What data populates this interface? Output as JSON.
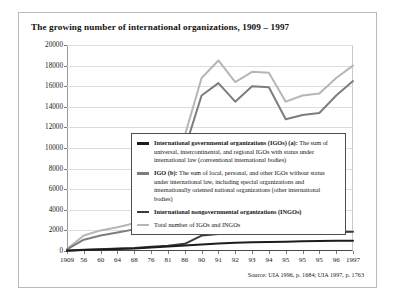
{
  "figure": {
    "title": "The growing number of international organizations, 1909 – 1997",
    "source": "Source: UIA 1996, p. 1684; UIA 1997, p. 1763"
  },
  "legend": {
    "entries": [
      {
        "name": "igo-a",
        "color": "#1c1c1c",
        "bold_label": "International governmental organizations (IGOs) (a):",
        "description": "The sum of universal, intercontinental, and regional IGOs with status under international law (conventional international bodies)"
      },
      {
        "name": "igo-b",
        "color": "#7d7d7d",
        "bold_label": "IGO (b):",
        "description": "The sum of local, personal, and other IGOs without status under international law, including special organizations and internationally oriented national organizations (other international bodies)"
      },
      {
        "name": "ingo",
        "color": "#3c3c3c",
        "bold_label": "International nongovernmental organizations (INGOs)",
        "description": ""
      },
      {
        "name": "total",
        "color": "#b6b6b6",
        "bold_label": "",
        "description": "Total number of IGOs and INGOs"
      }
    ]
  },
  "chart_data": {
    "type": "line",
    "title": "The growing number of international organizations, 1909 – 1997",
    "xlabel": "",
    "ylabel": "",
    "ylim": [
      0,
      20000
    ],
    "ytick_step": 2000,
    "yticks": [
      0,
      2000,
      4000,
      6000,
      8000,
      10000,
      12000,
      14000,
      16000,
      18000,
      20000
    ],
    "grid": true,
    "legend_position": "inset-center-right",
    "categories": [
      "1909",
      "56",
      "60",
      "64",
      "68",
      "76",
      "81",
      "86",
      "90",
      "91",
      "92",
      "93",
      "94",
      "95",
      "95",
      "95",
      "96",
      "1997"
    ],
    "series": [
      {
        "name": "Total number of IGOs and INGOs",
        "color": "#b6b6b6",
        "values": [
          200,
          1500,
          2000,
          2300,
          2700,
          4200,
          5200,
          11200,
          16800,
          18500,
          16400,
          17400,
          17300,
          14500,
          15100,
          15300,
          16800,
          18000
        ]
      },
      {
        "name": "IGO (b)",
        "color": "#7d7d7d",
        "values": [
          150,
          1100,
          1500,
          1800,
          2100,
          3400,
          4300,
          9900,
          15100,
          16300,
          14500,
          16000,
          15900,
          12800,
          13200,
          13400,
          15100,
          16500
        ]
      },
      {
        "name": "International nongovernmental organizations (INGOs)",
        "color": "#3c3c3c",
        "values": [
          40,
          120,
          180,
          240,
          300,
          420,
          520,
          700,
          1500,
          1650,
          1700,
          1750,
          1780,
          1800,
          1820,
          1830,
          1850,
          1870
        ]
      },
      {
        "name": "International governmental organizations (IGOs) (a)",
        "color": "#1c1c1c",
        "values": [
          30,
          90,
          140,
          190,
          250,
          350,
          430,
          540,
          640,
          720,
          790,
          840,
          880,
          910,
          940,
          960,
          985,
          1000
        ]
      }
    ]
  }
}
